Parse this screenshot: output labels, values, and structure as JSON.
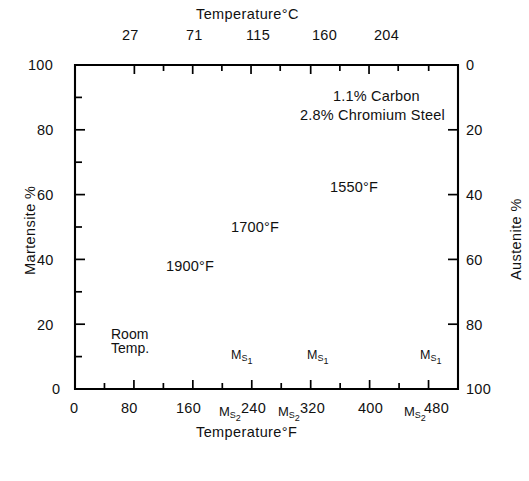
{
  "figure": {
    "top_axis_title": "Temperature°C",
    "bottom_axis_title": "Temperature°F",
    "left_axis_title": "Martensite %",
    "right_axis_title": "Austenite %",
    "annotation_line1": "1.1% Carbon",
    "annotation_line2": "2.8% Chromium Steel",
    "room_temp_line1": "Room",
    "room_temp_line2": "Temp.",
    "ms1_label": "M",
    "ms1_sub": "S",
    "ms1_sub2": "1",
    "ms2_label": "M",
    "ms2_sub": "S",
    "ms2_sub2": "2",
    "ms1_text": "Mₛ₁",
    "ms2_text": "Mₛ₂",
    "curve_labels": [
      "1550°F",
      "1700°F",
      "1900°F"
    ],
    "line_color": "#000000",
    "background_color": "#ffffff"
  },
  "chart_data": {
    "type": "line",
    "title": "",
    "subtitle": "",
    "xlabel": "Temperature°F",
    "ylabel": "Martensite %",
    "x2label": "Temperature°C",
    "y2label": "Austenite %",
    "xlim": [
      0,
      520
    ],
    "ylim": [
      0,
      100
    ],
    "y2lim": [
      0,
      100
    ],
    "grid": false,
    "legend": "inline-arrow-labels",
    "x_ticks_major": [
      0,
      80,
      160,
      240,
      320,
      400,
      480
    ],
    "x_tick_labels": [
      "0",
      "80",
      "160",
      "240",
      "320",
      "400",
      "480"
    ],
    "x_ticks_minor": [
      40,
      120,
      200,
      280,
      360,
      440
    ],
    "x2_ticks_major": [
      27,
      71,
      115,
      160,
      204
    ],
    "x2_tick_labels": [
      "27",
      "71",
      "115",
      "160",
      "204"
    ],
    "x2_ticks_minor_c": [
      49,
      93,
      137,
      182,
      226,
      249
    ],
    "y_ticks_major": [
      0,
      20,
      40,
      60,
      80,
      100
    ],
    "y_tick_labels": [
      "0",
      "20",
      "40",
      "60",
      "80",
      "100"
    ],
    "y_ticks_minor": [
      10,
      30,
      50,
      70,
      90
    ],
    "y2_ticks_major": [
      0,
      20,
      40,
      60,
      80,
      100
    ],
    "y2_tick_labels": [
      "0",
      "20",
      "40",
      "60",
      "80",
      "100"
    ],
    "room_temperature_f": 72,
    "series": [
      {
        "name": "1550°F",
        "label": "1550°F",
        "austenitizing_temperature_f": 1550,
        "ms1_f": 480,
        "ms2_f": 472,
        "points": [
          [
            72,
            100
          ],
          [
            100,
            99.5
          ],
          [
            130,
            98.5
          ],
          [
            160,
            96.5
          ],
          [
            190,
            93.5
          ],
          [
            215,
            90
          ],
          [
            240,
            85
          ],
          [
            265,
            79
          ],
          [
            290,
            72
          ],
          [
            315,
            64
          ],
          [
            340,
            55
          ],
          [
            365,
            45
          ],
          [
            390,
            35
          ],
          [
            415,
            25
          ],
          [
            440,
            15
          ],
          [
            460,
            7
          ],
          [
            472,
            1.5
          ],
          [
            478,
            0
          ]
        ]
      },
      {
        "name": "1700°F",
        "label": "1700°F",
        "austenitizing_temperature_f": 1700,
        "ms1_f": 310,
        "ms2_f": 300,
        "points": [
          [
            48,
            83
          ],
          [
            72,
            79
          ],
          [
            100,
            73.5
          ],
          [
            125,
            68
          ],
          [
            150,
            61.5
          ],
          [
            175,
            54
          ],
          [
            200,
            45.5
          ],
          [
            220,
            38
          ],
          [
            240,
            29.5
          ],
          [
            258,
            21
          ],
          [
            272,
            14
          ],
          [
            284,
            8
          ],
          [
            293,
            3.5
          ],
          [
            300,
            1
          ],
          [
            308,
            0
          ]
        ]
      },
      {
        "name": "1900°F",
        "label": "1900°F",
        "austenitizing_temperature_f": 1900,
        "ms1_f": 228,
        "ms2_f": 218,
        "points": [
          [
            20,
            64
          ],
          [
            48,
            58
          ],
          [
            72,
            52.5
          ],
          [
            96,
            46.5
          ],
          [
            120,
            40
          ],
          [
            145,
            32.5
          ],
          [
            165,
            26
          ],
          [
            183,
            19
          ],
          [
            198,
            13
          ],
          [
            210,
            7.5
          ],
          [
            218,
            3.5
          ],
          [
            224,
            1
          ],
          [
            230,
            0
          ]
        ]
      }
    ],
    "annotations": [
      {
        "text": "1.1% Carbon",
        "x_f": 330,
        "y_pct": 88
      },
      {
        "text": "2.8% Chromium Steel",
        "x_f": 345,
        "y_pct": 81
      },
      {
        "text": "Room Temp.",
        "x_f": 85,
        "y_pct": 14
      },
      {
        "text": "Mₛ₁",
        "x_f": 205,
        "y_pct": 8
      },
      {
        "text": "Mₛ₁",
        "x_f": 300,
        "y_pct": 8
      },
      {
        "text": "Mₛ₁",
        "x_f": 460,
        "y_pct": 8
      },
      {
        "text": "Mₛ₂",
        "x_f": 218,
        "y_pct": -6
      },
      {
        "text": "Mₛ₂",
        "x_f": 300,
        "y_pct": -6
      },
      {
        "text": "Mₛ₂",
        "x_f": 468,
        "y_pct": -6
      }
    ]
  }
}
